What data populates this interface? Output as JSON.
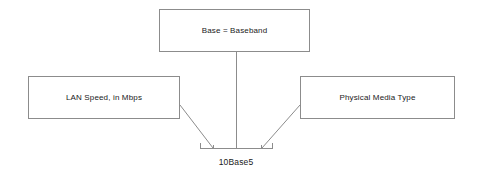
{
  "diagram": {
    "type": "callout-annotation-diagram",
    "subject": "10Base5",
    "caption": "10Base5",
    "stroke_color": "#8c8c8c",
    "text_color": "#1a1a1a",
    "background_color": "#ffffff",
    "boxes": [
      {
        "id": "base",
        "label": "Base = Baseband",
        "position": "top-center",
        "points_to": "Base"
      },
      {
        "id": "lan_speed",
        "label": "LAN Speed, in Mbps",
        "position": "middle-left",
        "points_to": "10"
      },
      {
        "id": "media_type",
        "label": "Physical Media Type",
        "position": "middle-right",
        "points_to": "5"
      }
    ],
    "bracket": {
      "label": "10Base5",
      "tick_count": 4,
      "end_caps": "upward"
    },
    "connectors": [
      {
        "from": "base",
        "to": "bracket-center",
        "style": "vertical-line"
      },
      {
        "from": "lan_speed",
        "to": "bracket-left",
        "style": "diagonal-line"
      },
      {
        "from": "media_type",
        "to": "bracket-right",
        "style": "diagonal-line"
      }
    ]
  }
}
